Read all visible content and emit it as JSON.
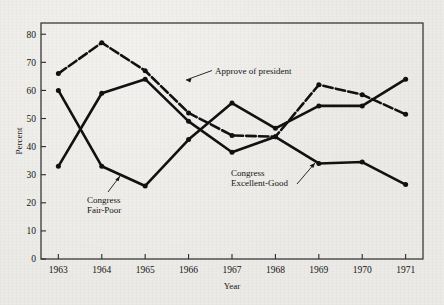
{
  "figure": {
    "background_color": "#eceae6",
    "ink_color": "#111111",
    "frame_color": "#2b2b2b"
  },
  "chart_data": {
    "type": "line",
    "title": "",
    "xlabel": "Year",
    "ylabel": "Percent",
    "categories": [
      "1963",
      "1964",
      "1965",
      "1966",
      "1967",
      "1968",
      "1969",
      "1970",
      "1971"
    ],
    "x": [
      1963,
      1964,
      1965,
      1966,
      1967,
      1968,
      1969,
      1970,
      1971
    ],
    "xlim": [
      1962.6,
      1971.4
    ],
    "ylim": [
      0,
      84
    ],
    "yticks": [
      0,
      10,
      20,
      30,
      40,
      50,
      60,
      70,
      80
    ],
    "ytick_labels": [
      "0",
      "10",
      "20",
      "30",
      "40",
      "50",
      "60",
      "70",
      "80"
    ],
    "grid": false,
    "legend_position": "inline-annotations",
    "series": [
      {
        "name": "Approve of president",
        "style": "dashed",
        "marker": "filled-circle",
        "values": [
          66,
          77,
          67,
          52,
          44,
          43.5,
          62,
          58.5,
          51.5
        ]
      },
      {
        "name": "Congress Fair-Poor",
        "style": "solid",
        "marker": "filled-circle",
        "values": [
          60,
          33,
          26,
          42.5,
          55.5,
          46.5,
          54.5,
          54.5,
          64
        ]
      },
      {
        "name": "Congress Excellent-Good",
        "style": "solid",
        "marker": "filled-circle",
        "values": [
          33,
          59,
          64,
          49,
          38,
          43.5,
          34,
          34.5,
          26.5
        ]
      }
    ],
    "annotations": [
      {
        "id": "approve-of-president",
        "text": "Approve of president",
        "lines": [
          "Approve of president"
        ],
        "points_to": "dashed series between 1965 and 1966"
      },
      {
        "id": "congress-fair-poor",
        "text": "Congress Fair-Poor",
        "lines": [
          "Congress",
          "Fair-Poor"
        ],
        "points_to": "solid series between 1964 and 1965"
      },
      {
        "id": "congress-excellent-good",
        "text": "Congress Excellent-Good",
        "lines": [
          "Congress",
          "Excellent-Good"
        ],
        "points_to": "solid series between 1968 and 1969"
      }
    ]
  }
}
